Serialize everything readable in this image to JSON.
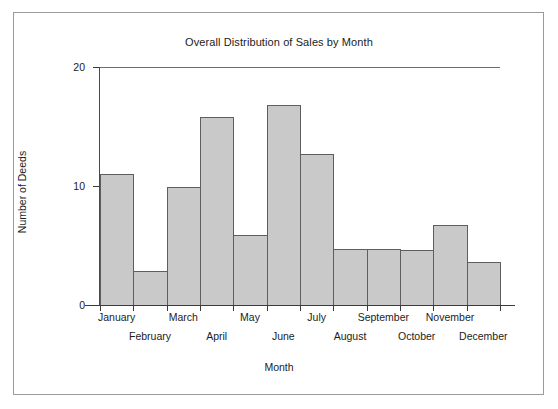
{
  "chart_data": {
    "type": "bar",
    "title": "Overall Distribution of Sales by Month",
    "xlabel": "Month",
    "ylabel": "Number of Deeds",
    "categories": [
      "January",
      "February",
      "March",
      "April",
      "May",
      "June",
      "July",
      "August",
      "September",
      "October",
      "November",
      "December"
    ],
    "values": [
      11,
      2.9,
      9.9,
      15.8,
      5.9,
      16.8,
      12.7,
      4.7,
      4.7,
      4.6,
      6.7,
      3.6
    ],
    "ylim": [
      0,
      20
    ],
    "yticks": [
      0,
      10,
      20
    ],
    "ytick_labels": [
      "0",
      "10",
      "20"
    ],
    "xlim_note": "contiguous histogram-style bars, one per month",
    "grid": false,
    "legend": null,
    "bar_fill_color": "#c9c9c9",
    "bar_border_color": "#5e5e5e",
    "axis_color": "#3a3a3a",
    "frame_color": "#9a9a9a",
    "background_color": "#ffffff"
  },
  "axis_labels_layout": {
    "row_top": [
      "January",
      "March",
      "May",
      "July",
      "September",
      "November"
    ],
    "row_bottom": [
      "February",
      "April",
      "June",
      "August",
      "October",
      "December"
    ]
  }
}
